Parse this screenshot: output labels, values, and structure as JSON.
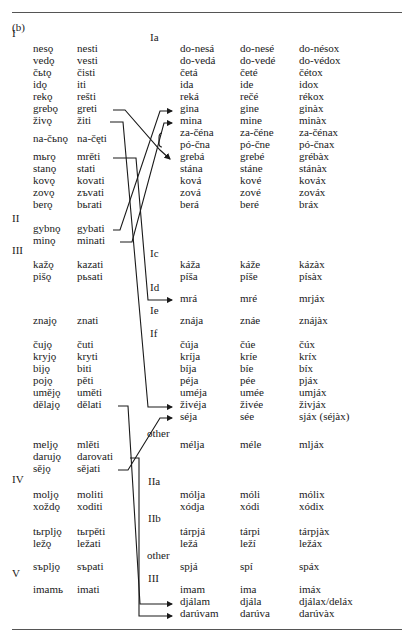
{
  "panel_label": "(b)",
  "section_labels": [
    {
      "text": "I",
      "y": 33
    },
    {
      "text": "II",
      "y": 218
    },
    {
      "text": "III",
      "y": 250
    },
    {
      "text": "IV",
      "y": 479
    },
    {
      "text": "V",
      "y": 573
    }
  ],
  "class_labels": [
    {
      "text": "Ia",
      "x": 150,
      "y": 37
    },
    {
      "text": "Ic",
      "x": 150,
      "y": 253
    },
    {
      "text": "Id",
      "x": 150,
      "y": 287
    },
    {
      "text": "Ie",
      "x": 150,
      "y": 310
    },
    {
      "text": "If",
      "x": 150,
      "y": 333
    },
    {
      "text": "other",
      "x": 147,
      "y": 433
    },
    {
      "text": "IIa",
      "x": 148,
      "y": 481
    },
    {
      "text": "IIb",
      "x": 148,
      "y": 518
    },
    {
      "text": "other",
      "x": 147,
      "y": 555
    },
    {
      "text": "III",
      "x": 148,
      "y": 578
    }
  ],
  "left_rows": [
    {
      "present": "nesǫ",
      "infinitive": "nesti",
      "y": 48
    },
    {
      "present": "vedǫ",
      "infinitive": "vesti",
      "y": 60
    },
    {
      "present": "čьtǫ",
      "infinitive": "čisti",
      "y": 72
    },
    {
      "present": "idǫ",
      "infinitive": "iti",
      "y": 84
    },
    {
      "present": "rekǫ",
      "infinitive": "rešti",
      "y": 96
    },
    {
      "present": "grebǫ",
      "infinitive": "greti",
      "y": 108
    },
    {
      "present": "živǫ",
      "infinitive": "žiti",
      "y": 120
    },
    {
      "present": "na-čьnǫ",
      "infinitive": "na-čęti",
      "y": 138
    },
    {
      "present": "mьrǫ",
      "infinitive": "mrěti",
      "y": 156
    },
    {
      "present": "stanǫ",
      "infinitive": "stati",
      "y": 168
    },
    {
      "present": "kovǫ",
      "infinitive": "kovati",
      "y": 180
    },
    {
      "present": "zovǫ",
      "infinitive": "zъvati",
      "y": 192
    },
    {
      "present": "berǫ",
      "infinitive": "bьrati",
      "y": 204
    },
    {
      "present": "gybnǫ",
      "infinitive": "gybati",
      "y": 228
    },
    {
      "present": "minǫ",
      "infinitive": "minati",
      "y": 240
    },
    {
      "present": "kažǫ",
      "infinitive": "kazati",
      "y": 264
    },
    {
      "present": "pišǫ",
      "infinitive": "pьsati",
      "y": 276
    },
    {
      "present": "znajǫ",
      "infinitive": "znati",
      "y": 320
    },
    {
      "present": "čujǫ",
      "infinitive": "čuti",
      "y": 344
    },
    {
      "present": "kryjǫ",
      "infinitive": "kryti",
      "y": 356
    },
    {
      "present": "bijǫ",
      "infinitive": "biti",
      "y": 368
    },
    {
      "present": "pojǫ",
      "infinitive": "pěti",
      "y": 380
    },
    {
      "present": "uměјǫ",
      "infinitive": "uměti",
      "y": 392
    },
    {
      "present": "dělajǫ",
      "infinitive": "dělati",
      "y": 404
    },
    {
      "present": "meljǫ",
      "infinitive": "mlěti",
      "y": 444
    },
    {
      "present": "darujǫ",
      "infinitive": "darovati",
      "y": 456
    },
    {
      "present": "sějǫ",
      "infinitive": "sějati",
      "y": 468
    },
    {
      "present": "moljǫ",
      "infinitive": "moliti",
      "y": 494
    },
    {
      "present": "xoždǫ",
      "infinitive": "xoditi",
      "y": 506
    },
    {
      "present": "tьrpljǫ",
      "infinitive": "tьrpěti",
      "y": 531
    },
    {
      "present": "ležǫ",
      "infinitive": "ležati",
      "y": 543
    },
    {
      "present": "sъpljǫ",
      "infinitive": "sъpati",
      "y": 566
    },
    {
      "present": "imamь",
      "infinitive": "imati",
      "y": 589
    }
  ],
  "right_rows": [
    {
      "c1": "do-nesá",
      "c2": "do-nesé",
      "c3": "do-nésox",
      "y": 48
    },
    {
      "c1": "do-vedá",
      "c2": "do-vedé",
      "c3": "do-védox",
      "y": 60
    },
    {
      "c1": "četá",
      "c2": "četé",
      "c3": "čétox",
      "y": 72
    },
    {
      "c1": "ida",
      "c2": "ide",
      "c3": "idox",
      "y": 84
    },
    {
      "c1": "reká",
      "c2": "rečé",
      "c3": "rékox",
      "y": 96
    },
    {
      "c1": "gina",
      "c2": "gine",
      "c3": "ginàx",
      "y": 108
    },
    {
      "c1": "mina",
      "c2": "mine",
      "c3": "minàx",
      "y": 120
    },
    {
      "c1": "za-čéna",
      "c2": "za-čéne",
      "c3": "za-čénax",
      "y": 132
    },
    {
      "c1": "pó-čna",
      "c2": "pó-čne",
      "c3": "pó-čnax",
      "y": 144
    },
    {
      "c1": "grebá",
      "c2": "grebé",
      "c3": "grébàx",
      "y": 156
    },
    {
      "c1": "stána",
      "c2": "stáne",
      "c3": "stánàx",
      "y": 168
    },
    {
      "c1": "ková",
      "c2": "kové",
      "c3": "kováx",
      "y": 180
    },
    {
      "c1": "zová",
      "c2": "zové",
      "c3": "zováx",
      "y": 192
    },
    {
      "c1": "berá",
      "c2": "beré",
      "c3": "bráx",
      "y": 204
    },
    {
      "c1": "káža",
      "c2": "káže",
      "c3": "kázàx",
      "y": 264
    },
    {
      "c1": "píša",
      "c2": "píše",
      "c3": "písàx",
      "y": 276
    },
    {
      "c1": "mrá",
      "c2": "mré",
      "c3": "mrjáx",
      "y": 298
    },
    {
      "c1": "znája",
      "c2": "znáe",
      "c3": "znájàx",
      "y": 320
    },
    {
      "c1": "čúja",
      "c2": "čúe",
      "c3": "čúx",
      "y": 344
    },
    {
      "c1": "kríja",
      "c2": "kríe",
      "c3": "kríx",
      "y": 356
    },
    {
      "c1": "bíja",
      "c2": "bíe",
      "c3": "bíx",
      "y": 368
    },
    {
      "c1": "péja",
      "c2": "pée",
      "c3": "pjáx",
      "y": 380
    },
    {
      "c1": "uméja",
      "c2": "umée",
      "c3": "umjáx",
      "y": 392
    },
    {
      "c1": "živéja",
      "c2": "živée",
      "c3": "živjáx",
      "y": 404
    },
    {
      "c1": "séja",
      "c2": "sée",
      "c3": "sjáx (séjàx)",
      "y": 416
    },
    {
      "c1": "mélja",
      "c2": "méle",
      "c3": "mljáx",
      "y": 444
    },
    {
      "c1": "mólja",
      "c2": "móli",
      "c3": "mólix",
      "y": 494
    },
    {
      "c1": "xódja",
      "c2": "xódi",
      "c3": "xódix",
      "y": 506
    },
    {
      "c1": "tárpjá",
      "c2": "tárpi",
      "c3": "tárpjàx",
      "y": 531
    },
    {
      "c1": "ležá",
      "c2": "leží",
      "c3": "ležáx",
      "y": 543
    },
    {
      "c1": "spjá",
      "c2": "spí",
      "c3": "spáx",
      "y": 566
    },
    {
      "c1": "imam",
      "c2": "ima",
      "c3": "imáx",
      "y": 589
    },
    {
      "c1": "djálam",
      "c2": "djála",
      "c3": "djálax/deláx",
      "y": 601
    },
    {
      "c1": "darúvam",
      "c2": "darúva",
      "c3": "darúvàx",
      "y": 613
    }
  ]
}
